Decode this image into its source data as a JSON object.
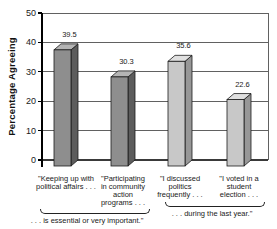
{
  "chart_data": {
    "type": "bar",
    "style": "3d-column",
    "title": "",
    "ylabel": "Percentage Agreeing",
    "xlabel": "",
    "ylim": [
      0,
      50
    ],
    "yticks": [
      0,
      10,
      20,
      30,
      40,
      50
    ],
    "grid": true,
    "legend": false,
    "categories": [
      "\"Keeping up with\npolitical affairs . . .",
      "\"Participating\nin community\naction\nprograms . . .",
      "\"I discussed\npolitics\nfrequently . . .",
      "\"I voted in a\nstudent\nelection . . ."
    ],
    "values": [
      39.5,
      30.3,
      35.6,
      22.6
    ],
    "value_labels": [
      "39.5",
      "30.3",
      "35.6",
      "22.6"
    ],
    "bar_palette": [
      "dark",
      "dark",
      "light",
      "light"
    ],
    "groups": [
      {
        "label": ". . . is essential or very important.\"",
        "start": 0,
        "end": 1
      },
      {
        "label": ". . . during the last year.\"",
        "start": 2,
        "end": 3
      }
    ],
    "colors": {
      "dark": {
        "front": "#8e8e8e",
        "side": "#5c5c5c",
        "top": "#b4b4b4"
      },
      "light": {
        "front": "#c8c8c8",
        "side": "#979797",
        "top": "#e0e0e0"
      },
      "outline": "#1c1c1c",
      "gridline": "#3a3a3a",
      "axis": "#000000",
      "background": "#ffffff"
    }
  }
}
